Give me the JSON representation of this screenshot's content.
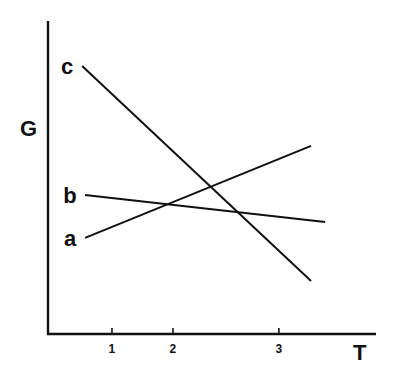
{
  "chart_data": {
    "type": "line",
    "title": "",
    "xlabel": "T",
    "ylabel": "G",
    "xlim": [
      0,
      100
    ],
    "ylim": [
      0,
      100
    ],
    "grid": false,
    "legend": "none (lines labeled directly at left end)",
    "x_ticks": [
      {
        "value": 19.5,
        "label": "1"
      },
      {
        "value": 38.1,
        "label": "2"
      },
      {
        "value": 70.4,
        "label": "3"
      }
    ],
    "series": [
      {
        "name": "a",
        "points": [
          {
            "x": 11.3,
            "y": 30.7
          },
          {
            "x": 80.2,
            "y": 60.1
          }
        ]
      },
      {
        "name": "b",
        "points": [
          {
            "x": 11.3,
            "y": 44.4
          },
          {
            "x": 84.5,
            "y": 35.8
          }
        ]
      },
      {
        "name": "c",
        "points": [
          {
            "x": 10.4,
            "y": 85.6
          },
          {
            "x": 80.2,
            "y": 16.9
          }
        ]
      }
    ],
    "colors": {
      "ink": "#111111",
      "background": "#ffffff"
    }
  }
}
